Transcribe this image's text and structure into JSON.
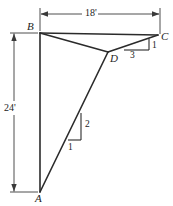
{
  "figure": {
    "stroke_color": "#2b2b2b",
    "dim_color": "#3a3a3a",
    "background": "#ffffff"
  },
  "vertices": {
    "a": {
      "label": "A",
      "x": 40,
      "y": 192,
      "label_x": 35,
      "label_y": 193
    },
    "b": {
      "label": "B",
      "x": 40,
      "y": 33,
      "label_x": 27,
      "label_y": 21
    },
    "c": {
      "label": "C",
      "x": 158,
      "y": 35,
      "label_x": 161,
      "label_y": 31
    },
    "d": {
      "label": "D",
      "x": 108,
      "y": 52,
      "label_x": 110,
      "label_y": 53
    }
  },
  "dimensions": {
    "horizontal": {
      "label": "18'",
      "label_x": 84,
      "label_y": 8,
      "line_y": 14,
      "x_start": 40,
      "x_end": 160
    },
    "vertical": {
      "label": "24'",
      "label_x": 3,
      "label_y": 103,
      "line_x": 14,
      "y_start": 33,
      "y_end": 192
    }
  },
  "slope_triangles": [
    {
      "name": "lower-chord-slope",
      "rise_label": "2",
      "run_label": "1",
      "rise_label_x": 85,
      "rise_label_y": 120,
      "run_label_x": 68,
      "run_label_y": 143
    },
    {
      "name": "upper-chord-slope",
      "rise_label": "1",
      "run_label": "3",
      "rise_label_x": 152,
      "rise_label_y": 41,
      "run_label_x": 130,
      "run_label_y": 51
    }
  ]
}
